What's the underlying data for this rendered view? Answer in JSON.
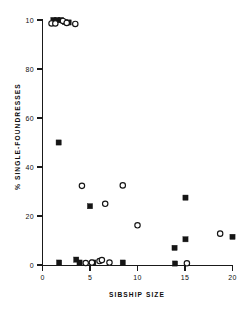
{
  "chart_data": {
    "type": "scatter",
    "title": "",
    "xlabel": "SIBSHIP  SIZE",
    "ylabel": "% SINGLE-FOUNDRESSES",
    "xlim": [
      0,
      20
    ],
    "ylim": [
      0,
      100
    ],
    "xticks": [
      0,
      5,
      10,
      15,
      20
    ],
    "yticks": [
      0,
      20,
      40,
      60,
      80,
      100
    ],
    "xticklabels": [
      "0",
      "5",
      "10",
      "15",
      "20"
    ],
    "yticklabels": [
      "0",
      "20",
      "40",
      "60",
      "80",
      "10"
    ],
    "grid": false,
    "legend": "none",
    "series": [
      {
        "name": "filled-square",
        "marker": "square",
        "fill": "#151515",
        "points": [
          {
            "x": 1.15,
            "y": 100
          },
          {
            "x": 1.55,
            "y": 100
          },
          {
            "x": 1.95,
            "y": 100
          },
          {
            "x": 2.35,
            "y": 99.2
          },
          {
            "x": 2.75,
            "y": 99.0
          },
          {
            "x": 1.7,
            "y": 50.0
          },
          {
            "x": 5.0,
            "y": 24.0
          },
          {
            "x": 15.05,
            "y": 27.5
          },
          {
            "x": 15.05,
            "y": 10.5
          },
          {
            "x": 13.9,
            "y": 7.0
          },
          {
            "x": 1.75,
            "y": 1.0
          },
          {
            "x": 3.55,
            "y": 2.2
          },
          {
            "x": 3.9,
            "y": 1.0
          },
          {
            "x": 5.35,
            "y": 1.0
          },
          {
            "x": 8.45,
            "y": 1.0
          },
          {
            "x": 13.95,
            "y": 0.6
          },
          {
            "x": 20.0,
            "y": 11.5
          }
        ]
      },
      {
        "name": "open-circle",
        "marker": "circle",
        "fill": "#ffffff",
        "points": [
          {
            "x": 0.95,
            "y": 98.6
          },
          {
            "x": 1.35,
            "y": 98.6
          },
          {
            "x": 2.15,
            "y": 99.6
          },
          {
            "x": 2.55,
            "y": 98.8
          },
          {
            "x": 3.45,
            "y": 98.4
          },
          {
            "x": 4.15,
            "y": 32.3
          },
          {
            "x": 8.45,
            "y": 32.5
          },
          {
            "x": 6.6,
            "y": 25.0
          },
          {
            "x": 10.0,
            "y": 16.2
          },
          {
            "x": 18.7,
            "y": 12.8
          },
          {
            "x": 4.55,
            "y": 0.8
          },
          {
            "x": 5.2,
            "y": 1.0
          },
          {
            "x": 6.0,
            "y": 1.6
          },
          {
            "x": 6.25,
            "y": 2.0
          },
          {
            "x": 7.05,
            "y": 1.0
          },
          {
            "x": 15.2,
            "y": 0.7
          }
        ]
      }
    ]
  },
  "axes": {
    "y_tick_labels": [
      "10",
      "80",
      "60",
      "40",
      "20",
      "0"
    ],
    "x_tick_labels": [
      "0",
      "5",
      "10",
      "15",
      "20"
    ],
    "x_title": "SIBSHIP   SIZE",
    "y_title": "% SINGLE-FOUNDRESSES"
  }
}
